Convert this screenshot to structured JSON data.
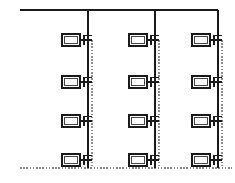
{
  "diagram": {
    "title": "Riser Schematic",
    "type": "engineering-schematic",
    "canvas": {
      "width": 235,
      "height": 183,
      "background": "#ffffff"
    },
    "colors": {
      "line": "#1a1a1a",
      "dashed": "#8c8c8c",
      "fill": "#ffffff"
    },
    "top_header": {
      "label": "top-header-main",
      "x1": 20,
      "y1": 10,
      "x2": 218,
      "y2": 10,
      "stroke_width": 1.4
    },
    "bottom_rail": {
      "label": "bottom-dashed-rail",
      "x1": 20,
      "y1": 168,
      "x2": 232,
      "y2": 168,
      "stroke_width": 1.6
    },
    "risers": [
      {
        "label": "riser-1",
        "x": 88,
        "y_top": 10,
        "y_bottom": 168,
        "dash_x": 92,
        "dash_top": 40,
        "dash_bottom": 168
      },
      {
        "label": "riser-2",
        "x": 155,
        "y_top": 10,
        "y_bottom": 168,
        "dash_x": 159,
        "dash_top": 40,
        "dash_bottom": 168
      },
      {
        "label": "riser-3",
        "x": 218,
        "y_top": 10,
        "y_bottom": 168,
        "dash_x": 222,
        "dash_top": 40,
        "dash_bottom": 168
      }
    ],
    "rows": [
      {
        "label": "row-1",
        "y": 40
      },
      {
        "label": "row-2",
        "y": 82
      },
      {
        "label": "row-3",
        "y": 121
      },
      {
        "label": "row-4",
        "y": 160
      }
    ],
    "device": {
      "label": "device-symbol",
      "box_width": 18,
      "box_height": 12,
      "offset_from_riser": 26,
      "stub_length": 8,
      "tick_length": 5
    },
    "devices": [
      {
        "id": "d-1-1",
        "name": "device-c1-r1",
        "col": 1,
        "row": 1,
        "x": 62,
        "y": 34
      },
      {
        "id": "d-1-2",
        "name": "device-c1-r2",
        "col": 1,
        "row": 2,
        "x": 62,
        "y": 76
      },
      {
        "id": "d-1-3",
        "name": "device-c1-r3",
        "col": 1,
        "row": 3,
        "x": 62,
        "y": 115
      },
      {
        "id": "d-1-4",
        "name": "device-c1-r4",
        "col": 1,
        "row": 4,
        "x": 62,
        "y": 154
      },
      {
        "id": "d-2-1",
        "name": "device-c2-r1",
        "col": 2,
        "row": 1,
        "x": 129,
        "y": 34
      },
      {
        "id": "d-2-2",
        "name": "device-c2-r2",
        "col": 2,
        "row": 2,
        "x": 129,
        "y": 76
      },
      {
        "id": "d-2-3",
        "name": "device-c2-r3",
        "col": 2,
        "row": 3,
        "x": 129,
        "y": 115
      },
      {
        "id": "d-2-4",
        "name": "device-c2-r4",
        "col": 2,
        "row": 4,
        "x": 129,
        "y": 154
      },
      {
        "id": "d-3-1",
        "name": "device-c3-r1",
        "col": 3,
        "row": 1,
        "x": 192,
        "y": 34
      },
      {
        "id": "d-3-2",
        "name": "device-c3-r2",
        "col": 3,
        "row": 2,
        "x": 192,
        "y": 76
      },
      {
        "id": "d-3-3",
        "name": "device-c3-r3",
        "col": 3,
        "row": 3,
        "x": 192,
        "y": 115
      },
      {
        "id": "d-3-4",
        "name": "device-c3-r4",
        "col": 3,
        "row": 4,
        "x": 192,
        "y": 154
      }
    ],
    "counts": {
      "columns": 3,
      "rows": 4,
      "devices_total": 12
    }
  }
}
